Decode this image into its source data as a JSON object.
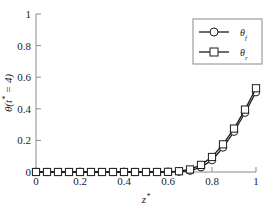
{
  "chart_data": {
    "type": "line",
    "title": "",
    "xlabel": "z*",
    "ylabel": "θ(t* = 4)",
    "xlim": [
      0,
      1
    ],
    "ylim": [
      0,
      1
    ],
    "grid": false,
    "legend_position": "top-right",
    "xticks": [
      "0",
      "0.2",
      "0.4",
      "0.6",
      "0.8",
      "1"
    ],
    "xtick_values": [
      0,
      0.2,
      0.4,
      0.6,
      0.8,
      1
    ],
    "yticks": [
      "0",
      "0.2",
      "0.4",
      "0.6",
      "0.8",
      "1"
    ],
    "ytick_values": [
      0,
      0.2,
      0.4,
      0.6,
      0.8,
      1
    ],
    "x": [
      0,
      0.05,
      0.1,
      0.15,
      0.2,
      0.25,
      0.3,
      0.35,
      0.4,
      0.45,
      0.5,
      0.55,
      0.6,
      0.65,
      0.7,
      0.75,
      0.8,
      0.85,
      0.9,
      0.95,
      1
    ],
    "series": [
      {
        "name": "θf",
        "label": "θ",
        "subscript": "f",
        "marker": "circle",
        "color": "#1c1c1c",
        "values": [
          0,
          0,
          0,
          0,
          0,
          0,
          0,
          0,
          0,
          0,
          0,
          0,
          0,
          0.002,
          0.008,
          0.03,
          0.075,
          0.155,
          0.255,
          0.375,
          0.505
        ]
      },
      {
        "name": "θr",
        "label": "θ",
        "subscript": "r",
        "marker": "square",
        "color": "#1c1c1c",
        "values": [
          0,
          0,
          0,
          0,
          0,
          0,
          0,
          0,
          0,
          0,
          0,
          0,
          0.001,
          0.005,
          0.016,
          0.045,
          0.095,
          0.175,
          0.275,
          0.395,
          0.53
        ]
      }
    ]
  },
  "legend": {
    "entries": [
      {
        "text": "θ",
        "sub": "f",
        "marker": "circle"
      },
      {
        "text": "θ",
        "sub": "r",
        "marker": "square"
      }
    ]
  },
  "axis": {
    "y_title_main": "θ(",
    "y_title_var": "t",
    "y_title_star": "*",
    "y_title_eq": " = 4)",
    "x_title_var": "z",
    "x_title_star": "*"
  }
}
